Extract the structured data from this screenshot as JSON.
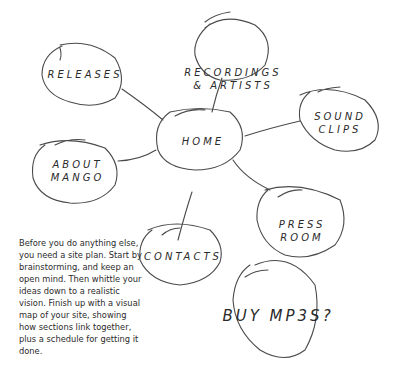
{
  "diagram": {
    "type": "site-map-sketch",
    "center_node": "HOME",
    "nodes": [
      {
        "id": "home",
        "label": "HOME"
      },
      {
        "id": "recordings",
        "label": "RECORDINGS\n& ARTISTS"
      },
      {
        "id": "releases",
        "label": "RELEASES"
      },
      {
        "id": "sound-clips",
        "label": "SOUND CLIPS"
      },
      {
        "id": "about",
        "label": "ABOUT\nMANGO"
      },
      {
        "id": "press",
        "label": "PRESS\nROOM"
      },
      {
        "id": "contacts",
        "label": "CONTACTS"
      },
      {
        "id": "buy",
        "label": "BUY MP3S?"
      }
    ],
    "edges": [
      [
        "home",
        "recordings"
      ],
      [
        "home",
        "releases"
      ],
      [
        "home",
        "sound-clips"
      ],
      [
        "home",
        "about"
      ],
      [
        "home",
        "press"
      ],
      [
        "home",
        "contacts"
      ]
    ]
  },
  "caption": "Before you do anything else, you need a site plan. Start by brainstorming, and keep an open mind. Then whittle your ideas down to a realistic vision. Finish up with a visual map of your site, showing how sections link together, plus a schedule for getting it done.",
  "colors": {
    "ink": "#4a4a4a",
    "background": "#ffffff"
  }
}
